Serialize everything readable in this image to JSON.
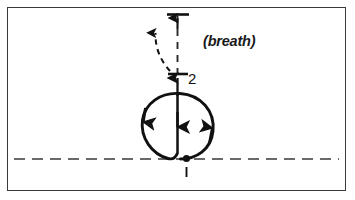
{
  "figure": {
    "background_color": "#ffffff",
    "ink_color": "#111111",
    "frame_color": "#3a3a3a"
  },
  "labels": {
    "breath": "(breath)",
    "stroke_one": "1",
    "stroke_two": "2"
  },
  "baseline": {
    "name": "baseline",
    "style": "dashed",
    "y": 159,
    "color": "#3a3a3a"
  },
  "guide_line": {
    "name": "vertical-ascender-guide",
    "style": "dashed",
    "color": "#2a2a2a",
    "top_tick_y": 14,
    "bottom_tick_y": 74
  },
  "elements": [
    {
      "name": "loop-path",
      "kind": "cardioid-loop",
      "direction": "counterclockwise"
    },
    {
      "name": "center-stem",
      "kind": "vertical-stroke",
      "direction": "down"
    },
    {
      "name": "ascender-stroke",
      "kind": "vertical-stroke",
      "direction": "up"
    },
    {
      "name": "breath-curve",
      "kind": "dashed-curved-arrow",
      "direction": "up-left"
    },
    {
      "name": "start-point-dot",
      "kind": "dot"
    }
  ]
}
